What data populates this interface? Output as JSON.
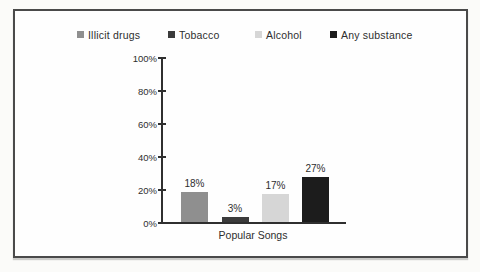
{
  "page": {
    "background_color": "#fbfbf9"
  },
  "frame": {
    "border_color": "#4a4a4a",
    "background_color": "#fefefe"
  },
  "chart_data": {
    "type": "bar",
    "title": "",
    "categories": [
      "Popular Songs"
    ],
    "xlabel": "Popular Songs",
    "ylabel": "",
    "ylim": [
      0,
      100
    ],
    "y_tick_labels": [
      "100%",
      "80%",
      "60%",
      "40%",
      "20%",
      "0%"
    ],
    "grid": false,
    "legend_position": "top",
    "series": [
      {
        "name": "Illicit drugs",
        "values": [
          18
        ],
        "value_label": "18%",
        "color": "#8f8f8f"
      },
      {
        "name": "Tobacco",
        "values": [
          3
        ],
        "value_label": "3%",
        "color": "#3b3b3b"
      },
      {
        "name": "Alcohol",
        "values": [
          17
        ],
        "value_label": "17%",
        "color": "#d6d6d6"
      },
      {
        "name": "Any substance",
        "values": [
          27
        ],
        "value_label": "27%",
        "color": "#1c1c1c"
      }
    ]
  }
}
